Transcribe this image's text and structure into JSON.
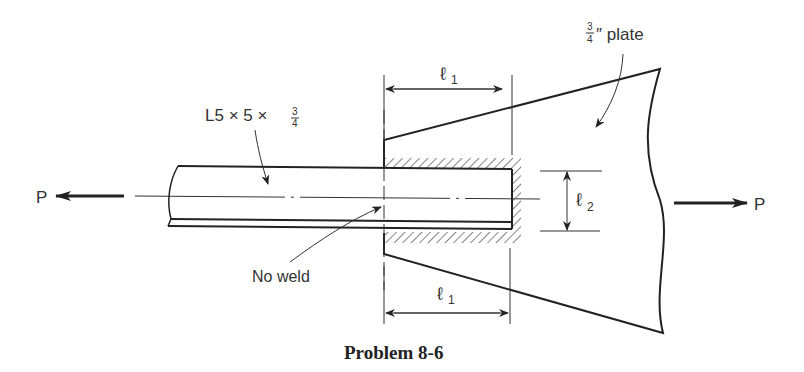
{
  "diagram": {
    "caption": "Problem 8-6",
    "angle_label": {
      "prefix": "L5 × 5 ×",
      "frac_num": "3",
      "frac_den": "4"
    },
    "plate_label": {
      "frac_num": "3",
      "frac_den": "4",
      "suffix": "″ plate"
    },
    "load_left": "P",
    "load_right": "P",
    "dim_l1_top": {
      "symbol": "ℓ",
      "sub": "1"
    },
    "dim_l1_bottom": {
      "symbol": "ℓ",
      "sub": "1"
    },
    "dim_l2": {
      "symbol": "ℓ",
      "sub": "2"
    },
    "no_weld_label": "No weld"
  }
}
